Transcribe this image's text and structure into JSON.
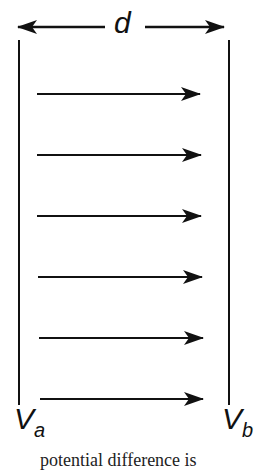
{
  "diagram": {
    "distance_label": "d",
    "left_plate": {
      "label_main": "V",
      "label_sub": "a"
    },
    "right_plate": {
      "label_main": "V",
      "label_sub": "b"
    },
    "field_lines": {
      "count": 6,
      "direction": "left-to-right"
    },
    "caption_partial": "potential difference is"
  }
}
